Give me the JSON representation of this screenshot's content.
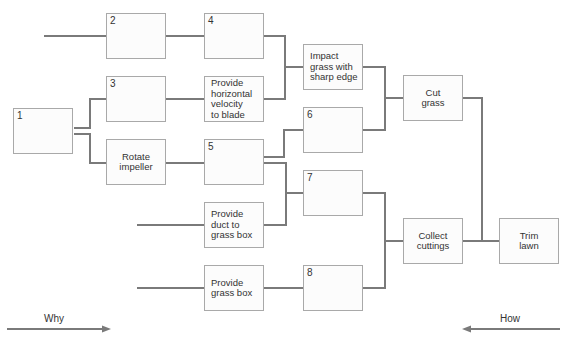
{
  "diagram": {
    "type": "function-tree (why-how diagram)",
    "colors": {
      "connector": "#7a7a7a",
      "box_border": "#a9a9a9",
      "box_fill": "#fcfcfc",
      "text": "#333333"
    },
    "nodes": {
      "n1": {
        "number": "1",
        "label": ""
      },
      "n2": {
        "number": "2",
        "label": ""
      },
      "n3": {
        "number": "3",
        "label": ""
      },
      "rotate_impeller": {
        "number": "",
        "label": "Rotate\nimpeller"
      },
      "n4": {
        "number": "4",
        "label": ""
      },
      "provide_horizontal": {
        "number": "",
        "label": "Provide\nhorizontal\nvelocity\nto blade"
      },
      "n5": {
        "number": "5",
        "label": ""
      },
      "provide_duct": {
        "number": "",
        "label": "Provide\nduct to\ngrass box"
      },
      "provide_grass_box": {
        "number": "",
        "label": "Provide\ngrass box"
      },
      "impact_grass": {
        "number": "",
        "label": "Impact\ngrass with\nsharp edge"
      },
      "n6": {
        "number": "6",
        "label": ""
      },
      "n7": {
        "number": "7",
        "label": ""
      },
      "n8": {
        "number": "8",
        "label": ""
      },
      "cut_grass": {
        "number": "",
        "label": "Cut\ngrass"
      },
      "collect_cuttings": {
        "number": "",
        "label": "Collect\ncuttings"
      },
      "trim_lawn": {
        "number": "",
        "label": "Trim\nlawn"
      }
    },
    "directions": {
      "why": {
        "label": "Why",
        "direction": "left-to-right"
      },
      "how": {
        "label": "How",
        "direction": "right-to-left"
      }
    }
  }
}
